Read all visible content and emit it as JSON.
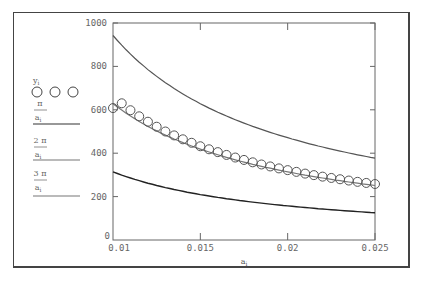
{
  "chart_data": {
    "type": "line",
    "title": "",
    "xlabel": "a_i",
    "ylabel": "",
    "xlim": [
      0.01,
      0.025
    ],
    "ylim": [
      0,
      1000
    ],
    "grid": false,
    "legend_position": "left",
    "x_ticks": [
      "0.01",
      "0.015",
      "0.02",
      "0.025"
    ],
    "y_ticks": [
      "0",
      "200",
      "400",
      "600",
      "800",
      "1000"
    ],
    "legend": [
      {
        "label": "y_i",
        "style": "circles"
      },
      {
        "label": "π / a_i",
        "style": "line"
      },
      {
        "label": "2 π / a_i",
        "style": "line"
      },
      {
        "label": "3 π / a_i",
        "style": "line"
      }
    ],
    "series": [
      {
        "name": "y_i",
        "style": "circles",
        "x": [
          0.01,
          0.0105,
          0.011,
          0.0115,
          0.012,
          0.0125,
          0.013,
          0.0135,
          0.014,
          0.0145,
          0.015,
          0.0155,
          0.016,
          0.0165,
          0.017,
          0.0175,
          0.018,
          0.0185,
          0.019,
          0.0195,
          0.02,
          0.0205,
          0.021,
          0.0215,
          0.022,
          0.0225,
          0.023,
          0.0235,
          0.024,
          0.0245,
          0.025
        ],
        "values": [
          608,
          630,
          598,
          570,
          545,
          522,
          500,
          482,
          464,
          448,
          432,
          418,
          405,
          392,
          380,
          369,
          358,
          348,
          339,
          330,
          322,
          314,
          306,
          299,
          292,
          286,
          280,
          274,
          268,
          263,
          258
        ]
      },
      {
        "name": "3π/a_i",
        "style": "line",
        "x": [
          0.01,
          0.0125,
          0.015,
          0.0175,
          0.02,
          0.0225,
          0.025
        ],
        "values": [
          942,
          754,
          628,
          539,
          471,
          419,
          377
        ]
      },
      {
        "name": "2π/a_i",
        "style": "line",
        "x": [
          0.01,
          0.0125,
          0.015,
          0.0175,
          0.02,
          0.0225,
          0.025
        ],
        "values": [
          628,
          503,
          419,
          359,
          314,
          279,
          251
        ]
      },
      {
        "name": "π/a_i",
        "style": "line",
        "x": [
          0.01,
          0.0125,
          0.015,
          0.0175,
          0.02,
          0.0225,
          0.025
        ],
        "values": [
          314,
          251,
          209,
          180,
          157,
          140,
          126
        ]
      }
    ]
  },
  "legend": {
    "y_label": "y",
    "y_sub": "i",
    "entries": [
      {
        "num": "π",
        "den": "a",
        "sub": "i"
      },
      {
        "num": "2 π",
        "den": "a",
        "sub": "i"
      },
      {
        "num": "3 π",
        "den": "a",
        "sub": "i"
      }
    ]
  },
  "axes": {
    "x_label": "a",
    "x_label_sub": "i"
  }
}
